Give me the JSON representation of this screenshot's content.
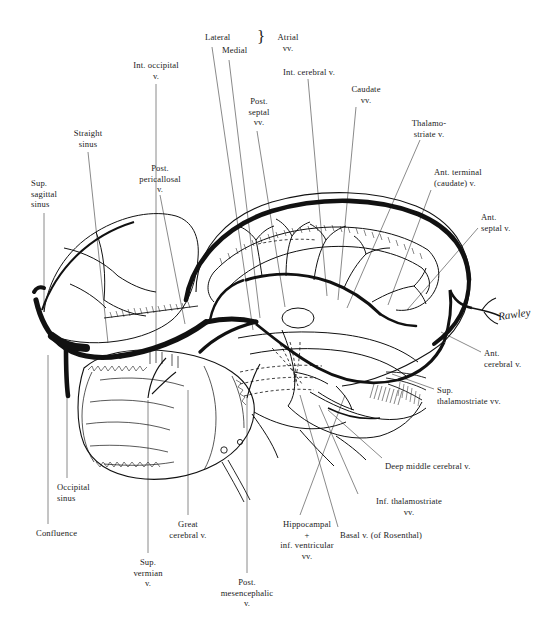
{
  "figure": {
    "kind": "anatomical-illustration",
    "ink_color": "#111111",
    "background_color": "#ffffff",
    "artist_signature": "Rawley"
  },
  "labels": [
    {
      "id": "int-occipital-v",
      "text": "Int. occipital\nv.",
      "align": "center",
      "x": 120,
      "y": 60,
      "w": 72
    },
    {
      "id": "lateral",
      "text": "Lateral",
      "align": "left",
      "x": 205,
      "y": 32,
      "w": 44
    },
    {
      "id": "medial",
      "text": "Medial",
      "align": "left",
      "x": 222,
      "y": 45,
      "w": 44
    },
    {
      "id": "atrial-vv",
      "text": "Atrial\nvv.",
      "align": "center",
      "x": 268,
      "y": 32,
      "w": 40
    },
    {
      "id": "int-cerebral-v",
      "text": "Int. cerebral v.",
      "align": "left",
      "x": 283,
      "y": 67,
      "w": 80
    },
    {
      "id": "caudate-vv",
      "text": "Caudate\nvv.",
      "align": "center",
      "x": 340,
      "y": 84,
      "w": 52
    },
    {
      "id": "post-septal-vv",
      "text": "Post.\nseptal\nvv.",
      "align": "center",
      "x": 238,
      "y": 96,
      "w": 42
    },
    {
      "id": "thalamostriate-v",
      "text": "Thalamo-\nstriate v.",
      "align": "center",
      "x": 400,
      "y": 118,
      "w": 58
    },
    {
      "id": "straight-sinus",
      "text": "Straight\nsinus",
      "align": "center",
      "x": 63,
      "y": 128,
      "w": 50
    },
    {
      "id": "ant-terminal-caudate-v",
      "text": "Ant. terminal\n(caudate) v.",
      "align": "left",
      "x": 434,
      "y": 167,
      "w": 76
    },
    {
      "id": "post-pericallosal-v",
      "text": "Post.\npericallosal\nv.",
      "align": "center",
      "x": 128,
      "y": 163,
      "w": 64
    },
    {
      "id": "sup-sagittal-sinus",
      "text": "Sup.\nsagittal\nsinus",
      "align": "left",
      "x": 31,
      "y": 178,
      "w": 48
    },
    {
      "id": "ant-septal-v",
      "text": "Ant.\nseptal v.",
      "align": "left",
      "x": 481,
      "y": 212,
      "w": 52
    },
    {
      "id": "ant-cerebral-v",
      "text": "Ant.\ncerebral v.",
      "align": "left",
      "x": 484,
      "y": 348,
      "w": 58
    },
    {
      "id": "sup-thalamostriate-vv",
      "text": "Sup.\nthalamostriate vv.",
      "align": "left",
      "x": 437,
      "y": 385,
      "w": 96
    },
    {
      "id": "deep-middle-cerebral-v",
      "text": "Deep middle cerebral v.",
      "align": "left",
      "x": 385,
      "y": 461,
      "w": 114
    },
    {
      "id": "occipital-sinus",
      "text": "Occipital\nsinus",
      "align": "left",
      "x": 57,
      "y": 482,
      "w": 52
    },
    {
      "id": "inf-thalamostriate-vv",
      "text": "Inf. thalamostriate\nvv.",
      "align": "center",
      "x": 362,
      "y": 496,
      "w": 94
    },
    {
      "id": "great-cerebral-v",
      "text": "Great\ncerebral v.",
      "align": "center",
      "x": 160,
      "y": 519,
      "w": 56
    },
    {
      "id": "hippocampal-inf-vent",
      "text": "Hippocampal\n+\ninf. ventricular\nvv.",
      "align": "center",
      "x": 262,
      "y": 519,
      "w": 90
    },
    {
      "id": "basal-v-rosenthal",
      "text": "Basal v. (of Rosenthal)",
      "align": "left",
      "x": 340,
      "y": 530,
      "w": 116
    },
    {
      "id": "confluence",
      "text": "Confluence",
      "align": "left",
      "x": 36,
      "y": 528,
      "w": 62
    },
    {
      "id": "sup-vermian-v",
      "text": "Sup.\nvermian\nv.",
      "align": "center",
      "x": 124,
      "y": 557,
      "w": 48
    },
    {
      "id": "post-mesencephalic-v",
      "text": "Post.\nmesencephalic\nv.",
      "align": "center",
      "x": 205,
      "y": 577,
      "w": 84
    }
  ],
  "leader_lines": [
    {
      "id": "leader-int-occipital-v",
      "points": "156,84 156,345"
    },
    {
      "id": "leader-lateral",
      "points": "212,47 253,330"
    },
    {
      "id": "leader-medial",
      "points": "229,60 260,318"
    },
    {
      "id": "leader-int-cerebral-v",
      "points": "308,79 327,296"
    },
    {
      "id": "leader-caudate-vv",
      "points": "356,107 338,300"
    },
    {
      "id": "leader-post-septal-vv",
      "points": "257,131 285,307"
    },
    {
      "id": "leader-thalamostriate-v",
      "points": "420,140 347,308"
    },
    {
      "id": "leader-straight-sinus",
      "points": "88,152 108,343"
    },
    {
      "id": "leader-ant-terminal-caudate-v",
      "points": "431,190 388,305"
    },
    {
      "id": "leader-post-pericallosal-v",
      "points": "160,195 185,324"
    },
    {
      "id": "leader-sup-sagittal-sinus",
      "points": "44,213 44,312"
    },
    {
      "id": "leader-ant-septal-v",
      "points": "478,228 407,310"
    },
    {
      "id": "leader-ant-cerebral-v",
      "points": "481,352 441,332"
    },
    {
      "id": "leader-sup-thalamostriate-vv",
      "points": "434,389 392,374"
    },
    {
      "id": "leader-deep-middle-cerebral-v",
      "points": "382,458 328,410"
    },
    {
      "id": "leader-occipital-sinus",
      "points": "67,478 67,385"
    },
    {
      "id": "leader-inf-thalamostriate-vv",
      "points": "358,494 319,405"
    },
    {
      "id": "leader-great-cerebral-v",
      "points": "188,515 188,390"
    },
    {
      "id": "leader-hippocampal-inf-vent",
      "points": "300,515 345,395"
    },
    {
      "id": "leader-basal-v-rosenthal",
      "points": "338,527 300,395"
    },
    {
      "id": "leader-confluence",
      "points": "48,524 48,355"
    },
    {
      "id": "leader-sup-vermian-v",
      "points": "148,553 148,400"
    },
    {
      "id": "leader-post-mesencephalic-v",
      "points": "247,573 247,398"
    }
  ]
}
